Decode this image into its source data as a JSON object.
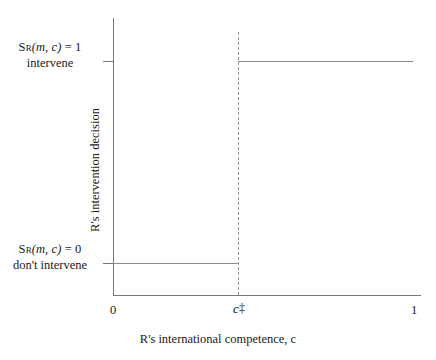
{
  "figure": {
    "background_color": "#ffffff",
    "axis_color": "#777777",
    "line_color": "#8a8a8a",
    "dash_color": "#9a9a9a",
    "text_color": "#1a1a1a"
  },
  "axes": {
    "x_title": "R's international competence, c",
    "y_title": "R's intervention decision",
    "x_ticks": [
      {
        "label": "0",
        "value": 0
      },
      {
        "label": "c‡",
        "value": 0.41
      },
      {
        "label": "1",
        "value": 1
      }
    ],
    "y_levels": [
      {
        "equation_prefix": "S",
        "equation_subscript": "R",
        "equation_args": "(m, c)",
        "equation_rest": " = 1",
        "equation_plain": "Sʀ(m, c) = 1",
        "description": "intervene",
        "value": 1
      },
      {
        "equation_prefix": "S",
        "equation_subscript": "R",
        "equation_args": "(m, c)",
        "equation_rest": " = 0",
        "equation_plain": "Sʀ(m, c) = 0",
        "description": "don't intervene",
        "value": 0
      }
    ]
  },
  "threshold": {
    "label_base": "c",
    "label_marker": "‡",
    "label": "c‡",
    "x_value": 0.41
  },
  "chart_data": {
    "type": "line",
    "title": "",
    "subtitle": "",
    "xlabel": "R's international competence, c",
    "ylabel": "R's intervention decision",
    "xlim": [
      0,
      1
    ],
    "ylim": [
      0,
      1
    ],
    "grid": false,
    "legend": null,
    "x_tick_labels": [
      "0",
      "c‡",
      "1"
    ],
    "x_tick_values": [
      0,
      0.41,
      1
    ],
    "y_tick_labels": [
      "Sʀ(m, c) = 0 / don't intervene",
      "Sʀ(m, c) = 1 / intervene"
    ],
    "y_tick_values": [
      0,
      1
    ],
    "series": [
      {
        "name": "R's intervention decision step function",
        "style": "step",
        "x": [
          0,
          0.41,
          0.41,
          1
        ],
        "values": [
          0,
          0,
          1,
          1
        ]
      }
    ],
    "annotations": [
      {
        "type": "vertical-dashed-line",
        "x": 0.41,
        "label": "c‡"
      }
    ]
  }
}
